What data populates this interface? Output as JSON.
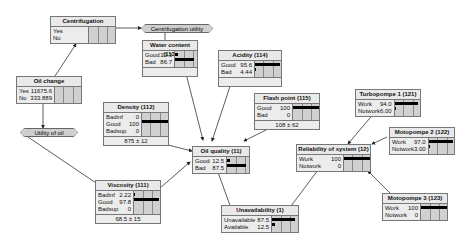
{
  "nodes": {
    "centrifugation": {
      "title": "Centrifugation",
      "states": [
        {
          "label": "Yes",
          "value": ""
        },
        {
          "label": "No",
          "value": ""
        }
      ]
    },
    "oil_change": {
      "title": "Oil change",
      "states": [
        {
          "label": "Yes",
          "value": "11675.6"
        },
        {
          "label": "No",
          "value": "333.889"
        }
      ]
    },
    "water_content": {
      "title": "Water content (113)",
      "states": [
        {
          "label": "Good",
          "value": "13.3",
          "pct": 13.3
        },
        {
          "label": "Bad",
          "value": "86.7",
          "pct": 86.7
        }
      ]
    },
    "acidity": {
      "title": "Acidity (114)",
      "states": [
        {
          "label": "Good",
          "value": "95.6",
          "pct": 95.6
        },
        {
          "label": "Bad",
          "value": "4.44",
          "pct": 4.44
        }
      ]
    },
    "flash_point": {
      "title": "Flash point (115)",
      "states": [
        {
          "label": "Good",
          "value": "100",
          "pct": 100
        },
        {
          "label": "Bad",
          "value": "0",
          "pct": 0
        }
      ],
      "footer": "108 ± 62"
    },
    "density": {
      "title": "Density (112)",
      "states": [
        {
          "label": "Badinf",
          "value": "0",
          "pct": 0
        },
        {
          "label": "Good",
          "value": "100",
          "pct": 100
        },
        {
          "label": "Badsup",
          "value": "0",
          "pct": 0
        }
      ],
      "footer": "875 ± 12"
    },
    "viscosity": {
      "title": "Viscosity (111)",
      "states": [
        {
          "label": "Badinf",
          "value": "2.22",
          "pct": 2.22
        },
        {
          "label": "Good",
          "value": "97.8",
          "pct": 97.8
        },
        {
          "label": "Badsup",
          "value": "0",
          "pct": 0
        }
      ],
      "footer": "68.5 ± 15"
    },
    "oil_quality": {
      "title": "Oil quality (11)",
      "states": [
        {
          "label": "Good",
          "value": "12.5",
          "pct": 12.5
        },
        {
          "label": "Bad",
          "value": "87.5",
          "pct": 87.5
        }
      ]
    },
    "turbopompe1": {
      "title": "Turbopompe 1 (121)",
      "states": [
        {
          "label": "Work",
          "value": "94.0",
          "pct": 94
        },
        {
          "label": "Notwork",
          "value": "6.00",
          "pct": 6
        }
      ]
    },
    "motopompe2": {
      "title": "Motopompe 2 (122)",
      "states": [
        {
          "label": "Work",
          "value": "97.0",
          "pct": 97
        },
        {
          "label": "Notwork",
          "value": "3.00",
          "pct": 3
        }
      ]
    },
    "reliability": {
      "title": "Reliability of system (12)",
      "states": [
        {
          "label": "Work",
          "value": "100",
          "pct": 100
        },
        {
          "label": "Notwork",
          "value": "0",
          "pct": 0
        }
      ]
    },
    "motopompe3": {
      "title": "Motopompe 3 (123)",
      "states": [
        {
          "label": "Work",
          "value": "100",
          "pct": 100
        },
        {
          "label": "Notwork",
          "value": "0",
          "pct": 0
        }
      ]
    },
    "unavailability": {
      "title": "Unavailability (1)",
      "states": [
        {
          "label": "Unavailable",
          "value": "87.5",
          "pct": 87.5
        },
        {
          "label": "Available",
          "value": "12.5",
          "pct": 12.5
        }
      ]
    }
  },
  "utilities": {
    "centrifugation_utility": "Centrifugation utility",
    "oil_change_utility": "Utility of oil change"
  }
}
